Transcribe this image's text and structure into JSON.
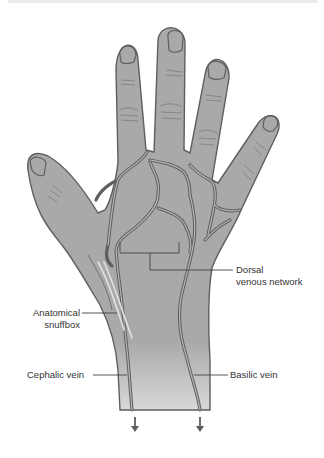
{
  "figure": {
    "colors": {
      "skin": "#a9a9a9",
      "outline": "#5e5e5e",
      "vein": "#6a6a6a",
      "leader": "#444444",
      "text": "#333333",
      "background": "#ffffff"
    },
    "labels": {
      "dorsal_line1": "Dorsal",
      "dorsal_line2": "venous network",
      "snuffbox_line1": "Anatomical",
      "snuffbox_line2": "snuffbox",
      "cephalic": "Cephalic vein",
      "basilic": "Basilic vein"
    },
    "arrows": [
      {
        "name": "cephalic-flow-arrow",
        "direction": "down"
      },
      {
        "name": "basilic-flow-arrow",
        "direction": "down"
      }
    ]
  }
}
